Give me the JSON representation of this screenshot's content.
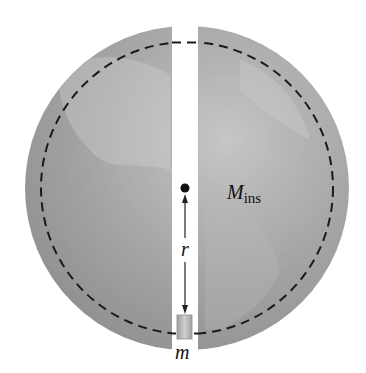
{
  "figure": {
    "labels": {
      "mass_inside_main": "M",
      "mass_inside_sub": "ins",
      "radius": "r",
      "mass": "m"
    },
    "colors": {
      "sphere": "#9a9a9a",
      "sphere_light": "#c4c4c4",
      "tunnel": "#ffffff",
      "dashed_circle": "#1a1a1a",
      "mass_block": "#b5b5b5"
    }
  }
}
